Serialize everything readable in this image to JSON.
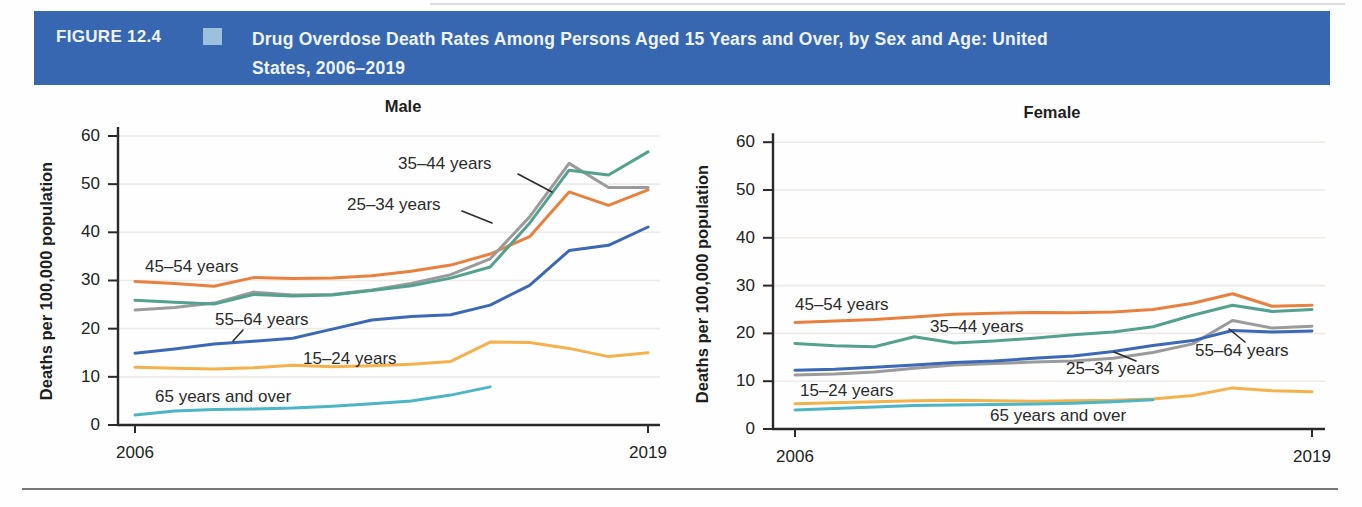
{
  "figure": {
    "label": "FIGURE 12.4",
    "title_line1": "Drug Overdose Death Rates Among Persons Aged 15 Years and Over, by Sex and Age: United",
    "title_line2": "States, 2006–2019"
  },
  "colors": {
    "banner_bg": "#3767b1",
    "banner_square": "#9cc0dd",
    "axis": "#2a2a2a",
    "grid": "#edeae7",
    "annotation_line": "#2b2b2b",
    "bottom_rule": "#4d4d4d"
  },
  "chart_data": [
    {
      "type": "line",
      "title": "Male",
      "xlabel": "",
      "ylabel": "Deaths per 100,000 population",
      "x": [
        2006,
        2007,
        2008,
        2009,
        2010,
        2011,
        2012,
        2013,
        2014,
        2015,
        2016,
        2017,
        2018,
        2019
      ],
      "x_tick_labels": [
        "2006",
        "2019"
      ],
      "yticks": [
        "0",
        "10",
        "20",
        "30",
        "40",
        "50",
        "60"
      ],
      "ylim": [
        0,
        60
      ],
      "grid": "horizontal",
      "legend_position": "inline-annotations",
      "series": [
        {
          "name": "45–54 years",
          "color": "#e8803f",
          "values": [
            29.8,
            29.4,
            28.8,
            30.6,
            30.4,
            30.5,
            31.0,
            31.9,
            33.2,
            35.5,
            39.1,
            48.4,
            45.6,
            48.8
          ]
        },
        {
          "name": "25–34 years",
          "color": "#9b9b9b",
          "values": [
            23.9,
            24.4,
            25.3,
            27.6,
            27.0,
            27.1,
            28.0,
            29.4,
            31.2,
            34.5,
            43.2,
            54.3,
            49.3,
            49.3
          ]
        },
        {
          "name": "35–44 years",
          "color": "#54a18f",
          "values": [
            25.9,
            25.5,
            25.1,
            27.1,
            26.8,
            27.0,
            27.9,
            28.9,
            30.5,
            32.8,
            41.9,
            52.9,
            51.9,
            56.7
          ]
        },
        {
          "name": "55–64 years",
          "color": "#3c69b7",
          "values": [
            14.9,
            15.8,
            16.8,
            17.4,
            18.0,
            19.9,
            21.8,
            22.5,
            22.9,
            24.9,
            29.0,
            36.2,
            37.3,
            41.1
          ]
        },
        {
          "name": "15–24 years",
          "color": "#f4b14c",
          "values": [
            12.0,
            11.8,
            11.6,
            11.9,
            12.4,
            12.1,
            12.3,
            12.6,
            13.2,
            17.2,
            17.1,
            15.9,
            14.2,
            15.0
          ]
        },
        {
          "name": "65 years and over",
          "color": "#4cb6c6",
          "values": [
            2.1,
            2.9,
            3.2,
            3.3,
            3.5,
            3.9,
            4.4,
            5.0,
            6.2,
            7.9
          ]
        }
      ]
    },
    {
      "type": "line",
      "title": "Female",
      "xlabel": "",
      "ylabel": "Deaths per 100,000 population",
      "x": [
        2006,
        2007,
        2008,
        2009,
        2010,
        2011,
        2012,
        2013,
        2014,
        2015,
        2016,
        2017,
        2018,
        2019
      ],
      "x_tick_labels": [
        "2006",
        "2019"
      ],
      "yticks": [
        "0",
        "10",
        "20",
        "30",
        "40",
        "50",
        "60"
      ],
      "ylim": [
        0,
        60
      ],
      "grid": "horizontal",
      "legend_position": "inline-annotations",
      "series": [
        {
          "name": "45–54 years",
          "color": "#e8803f",
          "values": [
            22.3,
            22.6,
            22.9,
            23.4,
            24.0,
            24.2,
            24.4,
            24.3,
            24.5,
            25.0,
            26.3,
            28.3,
            25.7,
            25.9
          ]
        },
        {
          "name": "25–34 years",
          "color": "#9b9b9b",
          "values": [
            11.3,
            11.5,
            11.9,
            12.7,
            13.4,
            13.7,
            14.0,
            14.2,
            14.8,
            16.0,
            17.8,
            22.7,
            21.1,
            21.5
          ]
        },
        {
          "name": "35–44 years",
          "color": "#54a18f",
          "values": [
            17.9,
            17.4,
            17.2,
            19.3,
            18.0,
            18.4,
            19.0,
            19.7,
            20.3,
            21.4,
            23.8,
            25.9,
            24.6,
            25.0
          ]
        },
        {
          "name": "55–64 years",
          "color": "#3c69b7",
          "values": [
            12.3,
            12.5,
            12.9,
            13.4,
            13.9,
            14.2,
            14.8,
            15.3,
            16.2,
            17.5,
            18.5,
            20.6,
            20.3,
            20.5
          ]
        },
        {
          "name": "15–24 years",
          "color": "#f4b14c",
          "values": [
            5.3,
            5.5,
            5.7,
            5.9,
            6.0,
            5.9,
            5.8,
            5.9,
            6.0,
            6.3,
            7.0,
            8.6,
            8.0,
            7.8
          ]
        },
        {
          "name": "65 years and over",
          "color": "#4cb6c6",
          "values": [
            4.0,
            4.3,
            4.6,
            4.9,
            5.0,
            5.1,
            5.2,
            5.4,
            5.7,
            6.1
          ]
        }
      ]
    }
  ]
}
